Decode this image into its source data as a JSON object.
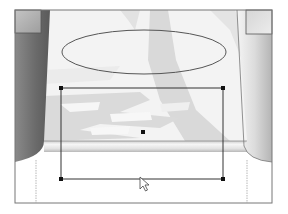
{
  "scene": {
    "description": "Drawing canvas with selected rectangle over a photo-like background",
    "colors": {
      "background": "#ffffff",
      "frame_line": "#777777",
      "left_column_dark": "#6e6e6e",
      "left_column_light": "#9a9a9a",
      "right_column_light": "#e6e6e6",
      "right_column_dark": "#bdbdbd",
      "photo_base": "#f2f2f2",
      "photo_shadow": "#d8d8d8",
      "shelf_light": "#f4f4f4",
      "shelf_dark": "#bfbfbf",
      "shape_stroke": "#555555",
      "handle_fill": "#111111"
    }
  },
  "shapes": {
    "ellipse": {
      "cx": 144,
      "cy": 52,
      "rx": 82,
      "ry": 22,
      "label": "ellipse-shape"
    },
    "rectangle": {
      "x": 61,
      "y": 88,
      "width": 162,
      "height": 91,
      "selected": true,
      "label": "selected-rectangle"
    },
    "center_handle": {
      "x": 143,
      "y": 132
    }
  },
  "cursor": {
    "x": 140,
    "y": 177,
    "type": "arrow-pointer"
  },
  "icons": {
    "cursor": "arrow-pointer-icon",
    "handle": "resize-handle-icon"
  }
}
